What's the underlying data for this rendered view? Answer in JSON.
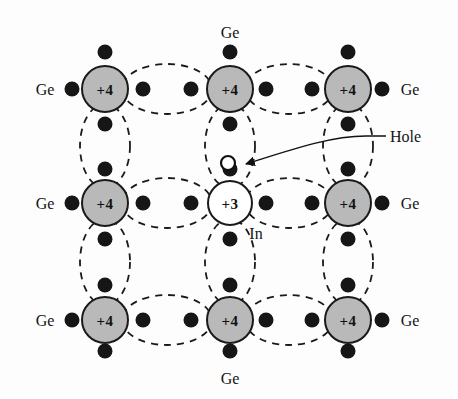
{
  "figure": {
    "background_color": "#fdfdfd",
    "width": 458,
    "height": 399
  },
  "colors": {
    "core_fill_ge": "#b9b9b9",
    "core_fill_in": "#ffffff",
    "core_stroke": "#1a1a1a",
    "electron_fill": "#161616",
    "bond_stroke": "#1a1a1a",
    "text": "#141414",
    "hole_stroke": "#111111",
    "hole_fill": "#ffffff"
  },
  "chart_data": {
    "type": "diagram",
    "lattice": {
      "rows": 3,
      "columns": 3,
      "column_x": [
        105,
        230,
        348
      ],
      "row_y": [
        89,
        203,
        320
      ],
      "core_radius": 23,
      "dopant_radius": 22
    },
    "atoms": [
      {
        "id": "ge-r0-c0",
        "label": "+4",
        "element": "Ge",
        "type": "host",
        "x": 105,
        "y": 89,
        "fill": "#b9b9b9"
      },
      {
        "id": "ge-r0-c1",
        "label": "+4",
        "element": "Ge",
        "type": "host",
        "x": 230,
        "y": 89,
        "fill": "#b9b9b9"
      },
      {
        "id": "ge-r0-c2",
        "label": "+4",
        "element": "Ge",
        "type": "host",
        "x": 348,
        "y": 89,
        "fill": "#b9b9b9"
      },
      {
        "id": "ge-r1-c0",
        "label": "+4",
        "element": "Ge",
        "type": "host",
        "x": 105,
        "y": 203,
        "fill": "#b9b9b9"
      },
      {
        "id": "in-r1-c1",
        "label": "+3",
        "element": "In",
        "type": "acceptor-dopant",
        "x": 230,
        "y": 203,
        "fill": "#ffffff"
      },
      {
        "id": "ge-r1-c2",
        "label": "+4",
        "element": "Ge",
        "type": "host",
        "x": 348,
        "y": 203,
        "fill": "#b9b9b9"
      },
      {
        "id": "ge-r2-c0",
        "label": "+4",
        "element": "Ge",
        "type": "host",
        "x": 105,
        "y": 320,
        "fill": "#b9b9b9"
      },
      {
        "id": "ge-r2-c1",
        "label": "+4",
        "element": "Ge",
        "type": "host",
        "x": 230,
        "y": 320,
        "fill": "#b9b9b9"
      },
      {
        "id": "ge-r2-c2",
        "label": "+4",
        "element": "Ge",
        "type": "host",
        "x": 348,
        "y": 320,
        "fill": "#b9b9b9"
      }
    ],
    "element_labels": [
      {
        "id": "ge-top",
        "text": "Ge",
        "x": 230,
        "y": 32
      },
      {
        "id": "ge-left-top",
        "text": "Ge",
        "x": 45,
        "y": 89
      },
      {
        "id": "ge-right-top",
        "text": "Ge",
        "x": 410,
        "y": 89
      },
      {
        "id": "ge-left-mid",
        "text": "Ge",
        "x": 45,
        "y": 203
      },
      {
        "id": "ge-right-mid",
        "text": "Ge",
        "x": 410,
        "y": 203
      },
      {
        "id": "ge-left-bottom",
        "text": "Ge",
        "x": 45,
        "y": 320
      },
      {
        "id": "ge-right-bottom",
        "text": "Ge",
        "x": 410,
        "y": 320
      },
      {
        "id": "ge-bottom",
        "text": "Ge",
        "x": 230,
        "y": 378
      },
      {
        "id": "in-dopant",
        "text": "In",
        "x": 256,
        "y": 233
      }
    ],
    "callouts": [
      {
        "id": "hole",
        "text": "Hole",
        "text_x": 390,
        "text_y": 136,
        "target_x": 240,
        "target_y": 165,
        "leader_path": "M 386 136 L 366 136 C 330 136 290 150 246 164"
      }
    ],
    "hole": {
      "id": "hole-marker",
      "x": 228,
      "y": 163,
      "radius": 7,
      "filled": false,
      "description": "open circle representing a vacant bond site"
    },
    "horizontal_bonds": [
      {
        "id": "hbond-r0-c0",
        "cx": 167,
        "cy": 89,
        "rx": 45,
        "ry": 25,
        "electrons": [
          {
            "x": 143,
            "y": 89
          },
          {
            "x": 191,
            "y": 89
          }
        ]
      },
      {
        "id": "hbond-r0-c1",
        "cx": 289,
        "cy": 89,
        "rx": 44,
        "ry": 25,
        "electrons": [
          {
            "x": 266,
            "y": 89
          },
          {
            "x": 312,
            "y": 89
          }
        ]
      },
      {
        "id": "hbond-r1-c0",
        "cx": 167,
        "cy": 203,
        "rx": 45,
        "ry": 25,
        "electrons": [
          {
            "x": 143,
            "y": 203
          },
          {
            "x": 191,
            "y": 203
          }
        ]
      },
      {
        "id": "hbond-r1-c1",
        "cx": 289,
        "cy": 203,
        "rx": 44,
        "ry": 25,
        "electrons": [
          {
            "x": 266,
            "y": 203
          },
          {
            "x": 312,
            "y": 203
          }
        ]
      },
      {
        "id": "hbond-r2-c0",
        "cx": 167,
        "cy": 320,
        "rx": 45,
        "ry": 25,
        "electrons": [
          {
            "x": 143,
            "y": 320
          },
          {
            "x": 191,
            "y": 320
          }
        ]
      },
      {
        "id": "hbond-r2-c1",
        "cx": 289,
        "cy": 320,
        "rx": 44,
        "ry": 25,
        "electrons": [
          {
            "x": 266,
            "y": 320
          },
          {
            "x": 312,
            "y": 320
          }
        ]
      }
    ],
    "vertical_bonds": [
      {
        "id": "vbond-c0-r0",
        "cx": 105,
        "cy": 146,
        "rx": 25,
        "ry": 42,
        "electrons": [
          {
            "x": 105,
            "y": 124
          },
          {
            "x": 105,
            "y": 169
          }
        ]
      },
      {
        "id": "vbond-c1-r0",
        "cx": 230,
        "cy": 146,
        "rx": 25,
        "ry": 42,
        "electrons": [
          {
            "x": 230,
            "y": 124
          },
          {
            "x": 230,
            "y": 169
          }
        ]
      },
      {
        "id": "vbond-c2-r0",
        "cx": 348,
        "cy": 146,
        "rx": 25,
        "ry": 42,
        "electrons": [
          {
            "x": 348,
            "y": 124
          },
          {
            "x": 348,
            "y": 169
          }
        ]
      },
      {
        "id": "vbond-c0-r1",
        "cx": 105,
        "cy": 262,
        "rx": 25,
        "ry": 43,
        "electrons": [
          {
            "x": 105,
            "y": 239
          },
          {
            "x": 105,
            "y": 285
          }
        ]
      },
      {
        "id": "vbond-c1-r1",
        "cx": 230,
        "cy": 262,
        "rx": 25,
        "ry": 43,
        "electrons": [
          {
            "x": 230,
            "y": 239
          },
          {
            "x": 230,
            "y": 285
          }
        ]
      },
      {
        "id": "vbond-c2-r1",
        "cx": 348,
        "cy": 262,
        "rx": 25,
        "ry": 43,
        "electrons": [
          {
            "x": 348,
            "y": 239
          },
          {
            "x": 348,
            "y": 285
          }
        ]
      }
    ],
    "free_electrons": [
      {
        "id": "e-top-c0",
        "x": 105,
        "y": 52
      },
      {
        "id": "e-top-c1",
        "x": 230,
        "y": 52
      },
      {
        "id": "e-top-c2",
        "x": 348,
        "y": 52
      },
      {
        "id": "e-left-r0",
        "x": 72,
        "y": 89
      },
      {
        "id": "e-right-r0",
        "x": 382,
        "y": 89
      },
      {
        "id": "e-left-r1",
        "x": 72,
        "y": 203
      },
      {
        "id": "e-right-r1",
        "x": 382,
        "y": 203
      },
      {
        "id": "e-left-r2",
        "x": 72,
        "y": 320
      },
      {
        "id": "e-right-r2",
        "x": 382,
        "y": 320
      },
      {
        "id": "e-bottom-c0",
        "x": 105,
        "y": 351
      },
      {
        "id": "e-bottom-c1",
        "x": 230,
        "y": 351
      },
      {
        "id": "e-bottom-c2",
        "x": 348,
        "y": 351
      }
    ],
    "electron_radius": 7.5,
    "bond_dash": "7 6"
  }
}
